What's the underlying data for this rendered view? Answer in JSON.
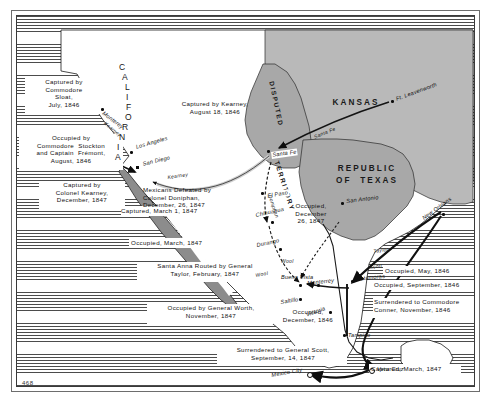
{
  "figure": {
    "page_number": "468",
    "kind": "historical-map"
  },
  "regions": [
    {
      "name": "CALIFORNIA",
      "style": "vertical-curved"
    },
    {
      "name": "KANSAS",
      "style": "horizontal"
    },
    {
      "name": "DISPUTED",
      "style": "curved"
    },
    {
      "name": "TERRITORY",
      "style": "curved"
    },
    {
      "name": "REPUBLIC",
      "style": "horizontal"
    },
    {
      "name": "OF  TEXAS",
      "style": "horizontal"
    }
  ],
  "places": [
    {
      "name": "Monterey",
      "marker": "dot"
    },
    {
      "name": "Los Angeles",
      "marker": "dot"
    },
    {
      "name": "San Diego",
      "marker": "square"
    },
    {
      "name": "Ft. Leavenworth",
      "marker": "dot"
    },
    {
      "name": "Santa Fe",
      "marker": "dot"
    },
    {
      "name": "El Paso",
      "marker": "dot"
    },
    {
      "name": "San Antonio",
      "marker": "dot"
    },
    {
      "name": "New Orleans",
      "marker": "dot"
    },
    {
      "name": "Chihuahua",
      "marker": "dot"
    },
    {
      "name": "Durango",
      "marker": "dot"
    },
    {
      "name": "Monterrey",
      "marker": "dot"
    },
    {
      "name": "Buena Vista",
      "marker": "dot"
    },
    {
      "name": "Saltillo",
      "marker": "dot"
    },
    {
      "name": "Matamoras",
      "marker": "dot"
    },
    {
      "name": "Victoria",
      "marker": "dot"
    },
    {
      "name": "Tampico",
      "marker": "dot"
    },
    {
      "name": "Vera Cruz",
      "marker": "ring"
    },
    {
      "name": "Mexico City",
      "marker": "ring"
    }
  ],
  "trails": [
    {
      "label": "Kearney",
      "section": "california"
    },
    {
      "label": "Kearney",
      "section": "southwest"
    },
    {
      "label": "Doniphan",
      "section": "chihuahua"
    },
    {
      "label": "Wool",
      "section": "north-mexico-upper"
    },
    {
      "label": "Wool",
      "section": "north-mexico-lower"
    },
    {
      "label": "Taylor",
      "section": "gulf"
    },
    {
      "label": "Scott",
      "section": "gulf"
    },
    {
      "label": "Santa Fe",
      "section": "trail"
    }
  ],
  "captions": [
    {
      "id": "sloat",
      "text": "Captured by\nCommodore\nSloat,\nJuly, 1846"
    },
    {
      "id": "stockton",
      "text": "Occupied by\nCommodore  Stockton\nand Captain  Frémont,\nAugust, 1846"
    },
    {
      "id": "kearney-ca",
      "text": "Captured by\nColonel Kearney,\nDecember, 1847"
    },
    {
      "id": "kearney-santafe",
      "text": "Captured by Kearney,\nAugust 18, 1846"
    },
    {
      "id": "doniphan",
      "text": "Mexicans Defeated by\nColonel Doniphan,\nDecember, 26, 1847"
    },
    {
      "id": "chihuahua-cap",
      "text": "Captured, March 1, 1847"
    },
    {
      "id": "durango-cap",
      "text": "Occupied, March, 1847"
    },
    {
      "id": "buenavista",
      "text": "Santa Anna Routed by General\nTaylor, February, 1847"
    },
    {
      "id": "saltillo-worth",
      "text": "Occupied by General Worth,\nNovember, 1847"
    },
    {
      "id": "victoria",
      "text": "Occupied,\nDecember, 1846"
    },
    {
      "id": "monterrey-occ",
      "text": "Occupied,\nDecember\n26, 1847"
    },
    {
      "id": "matamoras",
      "text": "Occupied, May, 1846"
    },
    {
      "id": "monterrey-sep",
      "text": "Occupied, September, 1846"
    },
    {
      "id": "conner",
      "text": "Surrendered to Commodore\nConner, November, 1846"
    },
    {
      "id": "scott-surrender",
      "text": "Surrendered to General Scott,\nSeptember, 14, 1847"
    },
    {
      "id": "veracruz",
      "text": "Captured, March, 1847"
    }
  ],
  "colors": {
    "ink": "#111111",
    "ocean_line": "#2c2c2c",
    "land": "#ffffff",
    "stipple": "#b9b9b9",
    "grey_region": "#a8a8a8",
    "frame": "#3a3a3a"
  }
}
